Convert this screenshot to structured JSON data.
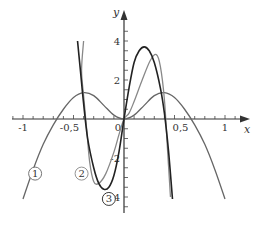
{
  "chart_data": {
    "type": "line",
    "title": "",
    "xlabel": "x",
    "ylabel": "y",
    "xlim": [
      -1.2,
      1.2
    ],
    "ylim": [
      -4.5,
      5
    ],
    "grid": false,
    "x_ticks": [
      {
        "value": -1,
        "label": "-1"
      },
      {
        "value": -0.5,
        "label": "-0,5"
      },
      {
        "value": 0,
        "label": "0"
      },
      {
        "value": 0.5,
        "label": "0,5"
      },
      {
        "value": 1,
        "label": "1"
      }
    ],
    "y_ticks": [
      {
        "value": 4,
        "label": "4"
      },
      {
        "value": 2,
        "label": "2"
      },
      {
        "value": -2,
        "label": "-2"
      },
      {
        "value": -4,
        "label": "-4"
      }
    ],
    "series": [
      {
        "name": "1",
        "color": "#666666",
        "width": 1.3,
        "points": [
          [
            -1.0,
            -4.1
          ],
          [
            -0.9,
            -2.6
          ],
          [
            -0.8,
            -1.3
          ],
          [
            -0.7,
            -0.3
          ],
          [
            -0.6,
            0.5
          ],
          [
            -0.5,
            1.1
          ],
          [
            -0.4,
            1.35
          ],
          [
            -0.3,
            1.2
          ],
          [
            -0.2,
            0.7
          ],
          [
            -0.1,
            0.2
          ],
          [
            0,
            0
          ],
          [
            0.1,
            0.2
          ],
          [
            0.2,
            0.7
          ],
          [
            0.3,
            1.2
          ],
          [
            0.4,
            1.35
          ],
          [
            0.5,
            1.1
          ],
          [
            0.6,
            0.5
          ],
          [
            0.7,
            -0.3
          ],
          [
            0.8,
            -1.3
          ],
          [
            0.9,
            -2.6
          ],
          [
            1.0,
            -4.1
          ]
        ],
        "label_position": [
          -0.88,
          -2.8
        ]
      },
      {
        "name": "2",
        "color": "#888888",
        "width": 1.3,
        "points": [
          [
            -0.4,
            4.0
          ],
          [
            -0.42,
            2.5
          ],
          [
            -0.4,
            1.2
          ],
          [
            -0.37,
            -0.5
          ],
          [
            -0.34,
            -2.2
          ],
          [
            -0.3,
            -3.2
          ],
          [
            -0.25,
            -3.3
          ],
          [
            -0.18,
            -2.8
          ],
          [
            -0.1,
            -1.7
          ],
          [
            -0.05,
            -0.8
          ],
          [
            0,
            0
          ],
          [
            0.05,
            0.3
          ],
          [
            0.1,
            0.9
          ],
          [
            0.18,
            2.0
          ],
          [
            0.26,
            3.0
          ],
          [
            0.32,
            3.3
          ],
          [
            0.36,
            2.7
          ],
          [
            0.4,
            1.0
          ],
          [
            0.43,
            -1.5
          ],
          [
            0.46,
            -4.0
          ]
        ],
        "label_position": [
          -0.42,
          -2.8
        ]
      },
      {
        "name": "3",
        "color": "#222222",
        "width": 1.6,
        "points": [
          [
            -0.46,
            4.0
          ],
          [
            -0.43,
            2.4
          ],
          [
            -0.4,
            0.8
          ],
          [
            -0.36,
            -1.0
          ],
          [
            -0.3,
            -2.5
          ],
          [
            -0.25,
            -3.3
          ],
          [
            -0.2,
            -3.6
          ],
          [
            -0.15,
            -3.5
          ],
          [
            -0.1,
            -2.9
          ],
          [
            -0.05,
            -1.7
          ],
          [
            0,
            0
          ],
          [
            0.05,
            1.6
          ],
          [
            0.1,
            2.9
          ],
          [
            0.15,
            3.5
          ],
          [
            0.2,
            3.7
          ],
          [
            0.25,
            3.5
          ],
          [
            0.3,
            2.9
          ],
          [
            0.36,
            1.6
          ],
          [
            0.4,
            0.3
          ],
          [
            0.44,
            -1.6
          ],
          [
            0.48,
            -4.1
          ]
        ],
        "label_position": [
          -0.15,
          -4.1
        ]
      }
    ]
  },
  "axes": {
    "x_label": "x",
    "y_label": "y"
  },
  "legend_labels": [
    "1",
    "2",
    "3"
  ]
}
